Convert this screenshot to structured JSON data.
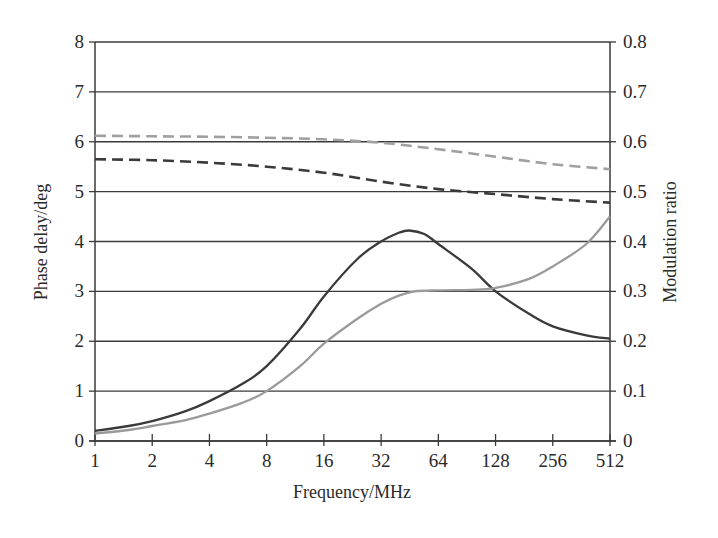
{
  "chart_data": {
    "type": "line",
    "title": "",
    "xlabel": "Frequency/MHz",
    "ylabel": "Phase delay/deg",
    "y2label": "Modulation ratio",
    "xscale": "log2",
    "x_ticks": [
      1,
      2,
      4,
      8,
      16,
      32,
      64,
      128,
      256,
      512
    ],
    "y_ticks": [
      0,
      1,
      2,
      3,
      4,
      5,
      6,
      7,
      8
    ],
    "y2_ticks": [
      "0",
      "0.1",
      "0.2",
      "0.3",
      "0.4",
      "0.5",
      "0.6",
      "0.7",
      "0.8"
    ],
    "xlim": [
      1,
      512
    ],
    "ylim": [
      0,
      8
    ],
    "y2lim": [
      0,
      0.8
    ],
    "grid": "horizontal",
    "legend": null,
    "series": [
      {
        "name": "Phase delay (dark solid)",
        "axis": "left",
        "style": "solid",
        "color": "#3a3a3a",
        "x": [
          1,
          1.5,
          2,
          3,
          4,
          6,
          8,
          12,
          16,
          24,
          32,
          40,
          45,
          54,
          64,
          96,
          128,
          192,
          256,
          384,
          512
        ],
        "values": [
          0.2,
          0.3,
          0.4,
          0.6,
          0.8,
          1.15,
          1.5,
          2.25,
          2.9,
          3.65,
          4.0,
          4.18,
          4.22,
          4.15,
          3.95,
          3.45,
          3.0,
          2.55,
          2.3,
          2.12,
          2.05
        ]
      },
      {
        "name": "Phase delay (light solid)",
        "axis": "left",
        "style": "solid",
        "color": "#9a9a9a",
        "x": [
          1,
          1.5,
          2,
          3,
          4,
          6,
          8,
          12,
          16,
          24,
          32,
          40,
          48,
          64,
          96,
          128,
          192,
          256,
          384,
          512
        ],
        "values": [
          0.15,
          0.22,
          0.3,
          0.42,
          0.55,
          0.77,
          1.0,
          1.5,
          1.95,
          2.45,
          2.75,
          2.92,
          3.0,
          3.02,
          3.03,
          3.07,
          3.25,
          3.5,
          3.95,
          4.5
        ]
      },
      {
        "name": "Modulation ratio (dark dashed)",
        "axis": "right",
        "style": "dashed",
        "color": "#3a3a3a",
        "x": [
          1,
          2,
          4,
          8,
          16,
          32,
          64,
          128,
          256,
          512
        ],
        "values": [
          0.565,
          0.563,
          0.558,
          0.55,
          0.538,
          0.52,
          0.505,
          0.495,
          0.485,
          0.478
        ]
      },
      {
        "name": "Modulation ratio (light dashed)",
        "axis": "right",
        "style": "dashed",
        "color": "#a0a0a0",
        "x": [
          1,
          2,
          4,
          8,
          16,
          32,
          64,
          128,
          256,
          512
        ],
        "values": [
          0.612,
          0.611,
          0.61,
          0.608,
          0.605,
          0.598,
          0.585,
          0.57,
          0.555,
          0.545
        ]
      }
    ]
  }
}
